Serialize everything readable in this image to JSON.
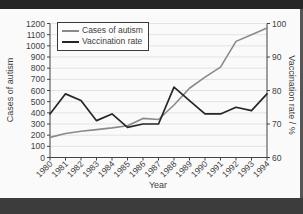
{
  "frame": {
    "top_band": "#262626",
    "bottom_band": "#3c3c3c",
    "right_strip": "#555555",
    "panel_bg": "#fafafa",
    "axis_color": "#444444",
    "grid_color": "#e3e3e3",
    "text_color": "#3f3f3f"
  },
  "chart_data": {
    "type": "line",
    "title": "",
    "xlabel": "Year",
    "ylabel_left": "Cases of autism",
    "ylabel_right": "Vaccination rate / %",
    "x": [
      "1980",
      "1981",
      "1982",
      "1983",
      "1984",
      "1985",
      "1986",
      "1987",
      "1988",
      "1989",
      "1990",
      "1991",
      "1992",
      "1993",
      "1994"
    ],
    "ylim_left": [
      0,
      1200
    ],
    "yticks_left": [
      0,
      100,
      200,
      300,
      400,
      500,
      600,
      700,
      800,
      900,
      1000,
      1100,
      1200
    ],
    "ylim_right": [
      60,
      100
    ],
    "yticks_right": [
      60,
      70,
      80,
      90,
      100
    ],
    "grid": true,
    "legend_position": "top-left",
    "series": [
      {
        "name": "Cases of autism",
        "axis": "left",
        "color": "#8a8a8a",
        "values": [
          180,
          215,
          235,
          250,
          265,
          285,
          350,
          340,
          470,
          620,
          720,
          810,
          1040,
          1100,
          1160
        ]
      },
      {
        "name": "Vaccination rate",
        "axis": "right",
        "color": "#262626",
        "values": [
          73,
          79,
          77,
          71,
          73,
          69,
          70,
          70,
          81,
          77,
          73,
          73,
          75,
          74,
          79
        ]
      }
    ]
  }
}
